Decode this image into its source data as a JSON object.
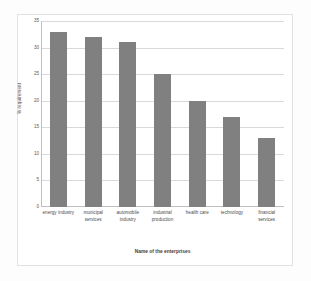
{
  "chart_data": {
    "type": "bar",
    "title": "",
    "xlabel": "Name of the enterprises",
    "ylabel": "% requirement",
    "categories": [
      "energy industry",
      "municipal services",
      "automobile industry",
      "industrial production",
      "health care",
      "technology",
      "financial services"
    ],
    "values": [
      33,
      32,
      31,
      25,
      20,
      17,
      13
    ],
    "ylim": [
      0,
      35
    ],
    "yticks": [
      0,
      5,
      10,
      15,
      20,
      25,
      30,
      35
    ],
    "ytick_labels": [
      "0",
      "5",
      "10",
      "15",
      "20",
      "25",
      "30",
      "35"
    ],
    "grid": "horizontal",
    "legend": "none",
    "series": [
      {
        "name": "% requirement",
        "values": [
          33,
          32,
          31,
          25,
          20,
          17,
          13
        ],
        "color": "#808080"
      }
    ]
  },
  "style": {
    "bar_color": "#808080",
    "gridline_color": "#d9d9d9",
    "axis_color": "#bfbfbf",
    "frame_color": "#e2e2e2",
    "background": "#ffffff"
  }
}
